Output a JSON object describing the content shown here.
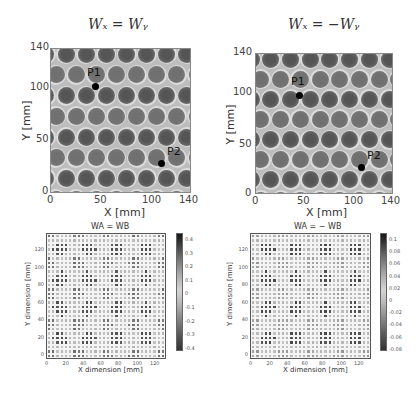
{
  "chart_data": [
    {
      "type": "heatmap",
      "title": "W_X = W_Y",
      "xlabel": "X [mm]",
      "ylabel": "Y [mm]",
      "xlim": [
        0,
        140
      ],
      "ylim": [
        0,
        140
      ],
      "xticks": [
        "0",
        "50",
        "100",
        "140"
      ],
      "yticks": [
        "0",
        "50",
        "100",
        "140"
      ],
      "description": "Grayscale image of a periodic lattice of dark circular spots with light rings on a mid-gray background",
      "annotations": [
        {
          "label": "P1",
          "x": 45,
          "y": 110
        },
        {
          "label": "P2",
          "x": 110,
          "y": 29
        }
      ]
    },
    {
      "type": "heatmap",
      "title": "W_X = -W_Y",
      "xlabel": "X [mm]",
      "ylabel": "Y [mm]",
      "xlim": [
        0,
        140
      ],
      "ylim": [
        0,
        140
      ],
      "xticks": [
        "0",
        "50",
        "100",
        "140"
      ],
      "yticks": [
        "0",
        "50",
        "100",
        "140"
      ],
      "description": "Grayscale image of a periodic lattice of dark circular spots with light rings on a mid-gray background",
      "annotations": [
        {
          "label": "P1",
          "x": 45,
          "y": 110
        },
        {
          "label": "P2",
          "x": 110,
          "y": 29
        }
      ]
    },
    {
      "type": "heatmap",
      "title": "WA = WB",
      "xlabel": "X dimension [mm]",
      "ylabel": "Y dimension [mm]",
      "xticks": [
        "0",
        "20",
        "40",
        "60",
        "80",
        "100",
        "120"
      ],
      "yticks": [
        "0",
        "20",
        "40",
        "60",
        "80",
        "100",
        "120"
      ],
      "colorbar": {
        "min": -0.45,
        "max": 0.45,
        "ticks": [
          "0.4",
          "0.3",
          "0.2",
          "0.1",
          "0",
          "-0.1",
          "-0.2",
          "-0.3",
          "-0.4"
        ]
      },
      "grid": true
    },
    {
      "type": "heatmap",
      "title": "WA = - WB",
      "xlabel": "X dimension [mm]",
      "ylabel": "Y dimension [mm]",
      "xticks": [
        "0",
        "20",
        "40",
        "60",
        "80",
        "100",
        "120"
      ],
      "yticks": [
        "0",
        "20",
        "40",
        "60",
        "80",
        "100",
        "120"
      ],
      "colorbar": {
        "min": -0.09,
        "max": 0.1,
        "ticks": [
          "0.1",
          "0.08",
          "0.06",
          "0.04",
          "0.02",
          "0",
          "-0.02",
          "-0.04",
          "-0.06",
          "-0.08"
        ]
      },
      "grid": true
    }
  ],
  "panels": {
    "tl": {
      "title": "Wₓ = Wᵧ",
      "xlabel": "X [mm]",
      "ylabel": "Y [mm]",
      "xticks": [
        "0",
        "50",
        "100",
        "140"
      ],
      "yticks": [
        "140",
        "100",
        "50",
        "0"
      ],
      "p1": "P1",
      "p2": "P2"
    },
    "tr": {
      "title": "Wₓ = −Wᵧ",
      "xlabel": "X [mm]",
      "ylabel": "Y [mm]",
      "xticks": [
        "0",
        "50",
        "100",
        "140"
      ],
      "yticks": [
        "140",
        "100",
        "50",
        "0"
      ],
      "p1": "P1",
      "p2": "P2"
    },
    "bl": {
      "title": "WA = WB",
      "xlabel": "X dimension [mm]",
      "ylabel": "Y dimension [mm]",
      "xticks": [
        "0",
        "20",
        "40",
        "60",
        "80",
        "100",
        "120"
      ],
      "yticks": [
        "120",
        "100",
        "80",
        "60",
        "40",
        "20",
        "0"
      ],
      "cticks": [
        "0.4",
        "0.3",
        "0.2",
        "0.1",
        "0",
        "-0.1",
        "-0.2",
        "-0.3",
        "-0.4"
      ]
    },
    "br": {
      "title": "WA = − WB",
      "xlabel": "X dimension [mm]",
      "ylabel": "Y dimension [mm]",
      "xticks": [
        "0",
        "20",
        "40",
        "60",
        "80",
        "100",
        "120"
      ],
      "yticks": [
        "120",
        "100",
        "80",
        "60",
        "40",
        "20",
        "0"
      ],
      "cticks": [
        "0.1",
        "0.08",
        "0.06",
        "0.04",
        "0.02",
        "0",
        "-0.02",
        "-0.04",
        "-0.06",
        "-0.08"
      ]
    }
  }
}
